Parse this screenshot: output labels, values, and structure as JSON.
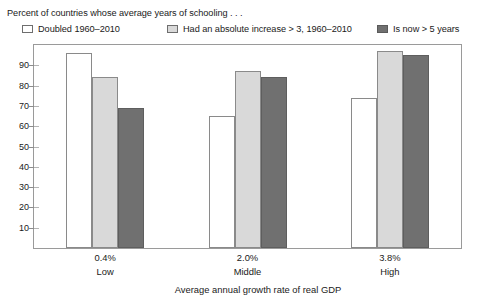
{
  "caption": "Percent of countries whose average years of schooling . . .",
  "legend": {
    "items": [
      {
        "label": "Doubled 1960–2010",
        "swatch": "white-swatch",
        "color": "#ffffff"
      },
      {
        "label": "Had an absolute increase > 3, 1960–2010",
        "swatch": "light-gray-swatch",
        "color": "#d9d9d9"
      },
      {
        "label": "Is now  > 5 years",
        "swatch": "dark-gray-swatch",
        "color": "#707070"
      }
    ]
  },
  "axis": {
    "x_title": "Average annual growth rate of real GDP",
    "y_ticks": [
      "90",
      "80",
      "70",
      "60",
      "50",
      "40",
      "30",
      "20",
      "10"
    ],
    "group_values": [
      "0.4%",
      "2.0%",
      "3.8%"
    ],
    "group_names": [
      "Low",
      "Middle",
      "High"
    ]
  },
  "chart_data": {
    "type": "bar",
    "title": "Percent of countries whose average years of schooling . . .",
    "xlabel": "Average annual growth rate of real GDP",
    "ylabel": "",
    "ylim": [
      0,
      100
    ],
    "yticks": [
      10,
      20,
      30,
      40,
      50,
      60,
      70,
      80,
      90
    ],
    "grid": false,
    "legend_position": "top",
    "categories": [
      "0.4% Low",
      "2.0% Middle",
      "3.8% High"
    ],
    "category_values": [
      "0.4%",
      "2.0%",
      "3.8%"
    ],
    "category_names": [
      "Low",
      "Middle",
      "High"
    ],
    "series": [
      {
        "name": "Doubled 1960–2010",
        "color": "#ffffff",
        "values": [
          96,
          65,
          74
        ]
      },
      {
        "name": "Had an absolute increase > 3, 1960–2010",
        "color": "#d9d9d9",
        "values": [
          84,
          87,
          97
        ]
      },
      {
        "name": "Is now  > 5 years",
        "color": "#707070",
        "values": [
          69,
          84,
          95
        ]
      }
    ]
  }
}
